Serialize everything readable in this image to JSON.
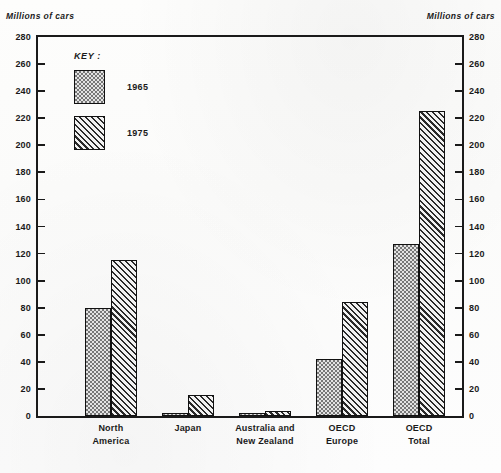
{
  "axis_caption_left": "Millions of cars",
  "axis_caption_right": "Millions of cars",
  "legend": {
    "title": "KEY :",
    "entries": [
      {
        "label": "1965",
        "pattern": "dotted"
      },
      {
        "label": "1975",
        "pattern": "diagonal-hatch"
      }
    ]
  },
  "chart_data": {
    "type": "bar",
    "title": "",
    "subtitle": "",
    "xlabel": "",
    "ylabel": "Millions of cars",
    "y2label": "Millions of cars",
    "ylim": [
      0,
      280
    ],
    "ytick_step": 20,
    "yticks": [
      0,
      20,
      40,
      60,
      80,
      100,
      120,
      140,
      160,
      180,
      200,
      220,
      240,
      260,
      280
    ],
    "grid": false,
    "legend_position": "top-left-inside",
    "categories": [
      "North\nAmerica",
      "Japan",
      "Australia and\nNew Zealand",
      "OECD\nEurope",
      "OECD\nTotal"
    ],
    "category_lines": [
      [
        "North",
        "America"
      ],
      [
        "Japan",
        ""
      ],
      [
        "Australia and",
        "New Zealand"
      ],
      [
        "OECD",
        "Europe"
      ],
      [
        "OECD",
        "Total"
      ]
    ],
    "series": [
      {
        "name": "1965",
        "pattern": "dotted",
        "values": [
          80,
          1,
          1.5,
          42,
          127
        ]
      },
      {
        "name": "1975",
        "pattern": "diagonal-hatch",
        "values": [
          115,
          16,
          4,
          84,
          225
        ]
      }
    ]
  },
  "colors": {
    "ink": "#1a1a1a",
    "fill_1965": "#e3e3e3",
    "fill_1975": "#f2f2f2",
    "page": "#ffffff"
  }
}
